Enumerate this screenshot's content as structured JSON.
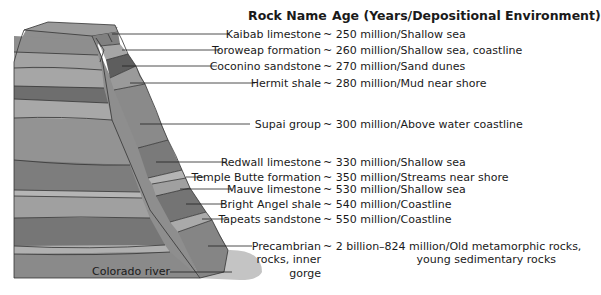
{
  "header": {
    "rock_name": "Rock Name",
    "age": "Age (Years/Depositional Environment)"
  },
  "layers": [
    {
      "rock": "Kaibab limestone",
      "age": "~ 250 million/Shallow sea",
      "color": "#8e8e8e"
    },
    {
      "rock": "Toroweap formation",
      "age": "~ 260 million/Shallow sea, coastline",
      "color": "#a6a6a6"
    },
    {
      "rock": "Coconino sandstone",
      "age": "~ 270 million/Sand dunes",
      "color": "#6a6a6a"
    },
    {
      "rock": "Hermit shale",
      "age": "~ 280 million/Mud near shore",
      "color": "#9a9a9a"
    },
    {
      "rock": "Supai group",
      "age": "~ 300 million/Above water coastline",
      "color": "#8a8a8a"
    },
    {
      "rock": "Redwall limestone",
      "age": "~ 330 million/Shallow sea",
      "color": "#7a7a7a"
    },
    {
      "rock": "Temple Butte formation",
      "age": "~ 350 million/Streams near shore",
      "color": "#b4b4b4"
    },
    {
      "rock": "Mauve limestone",
      "age": "~ 530 million/Shallow sea",
      "color": "#a0a0a0"
    },
    {
      "rock": "Bright Angel shale",
      "age": "~ 540 million/Coastline",
      "color": "#747474"
    },
    {
      "rock": "Tapeats sandstone",
      "age": "~ 550 million/Coastline",
      "color": "#aaaaaa"
    },
    {
      "rock": "Precambrian",
      "age": "~ 2 billion–824 million/Old metamorphic rocks,",
      "color": "#858585"
    }
  ],
  "precambrian_extra": {
    "rock_line2": "rocks, inner",
    "rock_line3": "gorge",
    "age_line2": "young sedimentary rocks"
  },
  "river": {
    "label": "Colorado river",
    "color": "#c4c4c4"
  },
  "colors": {
    "outline": "#333333",
    "leader": "#222222"
  }
}
